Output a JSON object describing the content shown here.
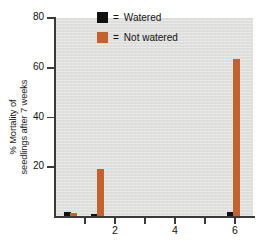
{
  "chart_data": {
    "type": "bar",
    "title": "",
    "xlabel": "",
    "ylabel_line1": "% Mortality of",
    "ylabel_line2": "seedlings after 7 weeks",
    "ylim": [
      0,
      80
    ],
    "xlim": [
      0,
      6.6
    ],
    "grid": false,
    "legend_position": "top-center",
    "y_ticks": [
      {
        "value": 20,
        "label": "20"
      },
      {
        "value": 40,
        "label": "40"
      },
      {
        "value": 60,
        "label": "60"
      },
      {
        "value": 80,
        "label": "80"
      }
    ],
    "x_ticks": [
      {
        "value": 1,
        "label": ""
      },
      {
        "value": 2,
        "label": "2"
      },
      {
        "value": 3,
        "label": ""
      },
      {
        "value": 4,
        "label": "4"
      },
      {
        "value": 5,
        "label": ""
      },
      {
        "value": 6,
        "label": "6"
      }
    ],
    "series": [
      {
        "name": "Watered",
        "color": "#111111",
        "points": [
          {
            "x": 0.42,
            "value": 2.0
          },
          {
            "x": 1.3,
            "value": 1.2
          },
          {
            "x": 5.85,
            "value": 2.2
          }
        ]
      },
      {
        "name": "Not watered",
        "color": "#c4622d",
        "points": [
          {
            "x": 0.6,
            "value": 1.8
          },
          {
            "x": 1.52,
            "value": 19.2
          },
          {
            "x": 6.05,
            "value": 63.5
          }
        ]
      }
    ]
  },
  "legend": {
    "equals": "=",
    "items": [
      {
        "label": "Watered",
        "swatch": "black-square-swatch",
        "color": "#111111"
      },
      {
        "label": "Not watered",
        "swatch": "orange-square-swatch",
        "color": "#c4622d"
      }
    ]
  },
  "colors": {
    "plot_background": "#dededd",
    "axis": "#3a3a3a",
    "watered": "#111111",
    "not_watered": "#c4622d",
    "page_background": "#ffffff"
  }
}
